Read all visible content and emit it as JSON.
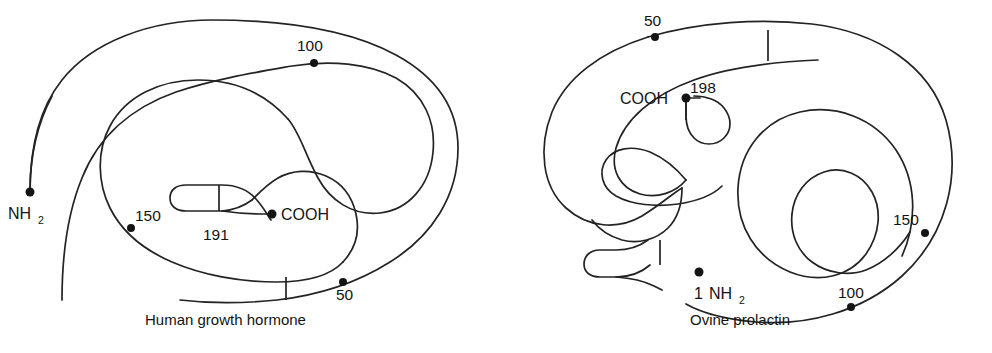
{
  "figure": {
    "background_color": "#ffffff",
    "line_color": "#232323",
    "marker_color": "#141414"
  },
  "panels": [
    {
      "id": "human-growth-hormone",
      "caption": "Human growth hormone",
      "n_terminus": {
        "label_text": "NH",
        "label_subscript": "2",
        "residue_number": null
      },
      "c_terminus": {
        "label_text": "COOH",
        "residue_number": "191"
      },
      "residue_markers": [
        {
          "label": "50"
        },
        {
          "label": "100"
        },
        {
          "label": "150"
        }
      ],
      "disulfide_bridge_count": 2
    },
    {
      "id": "ovine-prolactin",
      "caption": "Ovine prolactin",
      "n_terminus": {
        "label_text": "NH",
        "label_subscript": "2",
        "residue_number": "1"
      },
      "c_terminus": {
        "label_text": "COOH",
        "residue_number": "198"
      },
      "residue_markers": [
        {
          "label": "50"
        },
        {
          "label": "100"
        },
        {
          "label": "150"
        }
      ],
      "disulfide_bridge_count": 3
    }
  ],
  "labels": {
    "hgh": {
      "nh2_main": "NH",
      "nh2_sub": "2",
      "num_50": "50",
      "num_100": "100",
      "num_150": "150",
      "num_191": "191",
      "cooh": "COOH",
      "caption": "Human growth hormone"
    },
    "prl": {
      "nh2_num": "1",
      "nh2_main": "NH",
      "nh2_sub": "2",
      "num_50": "50",
      "num_100": "100",
      "num_150": "150",
      "num_198": "198",
      "cooh": "COOH",
      "caption": "Ovine prolactin"
    }
  }
}
